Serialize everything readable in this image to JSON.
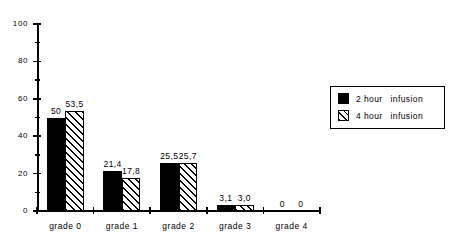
{
  "chart_data": {
    "type": "bar",
    "title": "",
    "xlabel": "",
    "ylabel": "",
    "categories": [
      "grade 0",
      "grade 1",
      "grade 2",
      "grade 3",
      "grade 4"
    ],
    "series": [
      {
        "name": "2 hour infusion",
        "pattern": "solid-black",
        "values": [
          50,
          21.4,
          25.5,
          3.1,
          0
        ],
        "labels": [
          "50",
          "21,4",
          "25,5",
          "3,1",
          "0"
        ]
      },
      {
        "name": "4 hour infusion",
        "pattern": "diagonal-hatch",
        "values": [
          53.5,
          17.8,
          25.7,
          3.0,
          0
        ],
        "labels": [
          "53,5",
          "17,8",
          "25,7",
          "3,0",
          "0"
        ]
      }
    ],
    "ylim": [
      0,
      100
    ],
    "ytick_labels": [
      "0",
      "20",
      "40",
      "60",
      "80",
      "100"
    ],
    "ytick_values": [
      0,
      20,
      40,
      60,
      80,
      100
    ],
    "yminor_values": [
      10,
      30,
      50,
      70,
      90
    ],
    "grid": false,
    "legend_position": "top-right"
  },
  "legend": {
    "entries": [
      {
        "duration": "2 hour",
        "type": "infusion"
      },
      {
        "duration": "4 hour",
        "type": "infusion"
      }
    ]
  }
}
